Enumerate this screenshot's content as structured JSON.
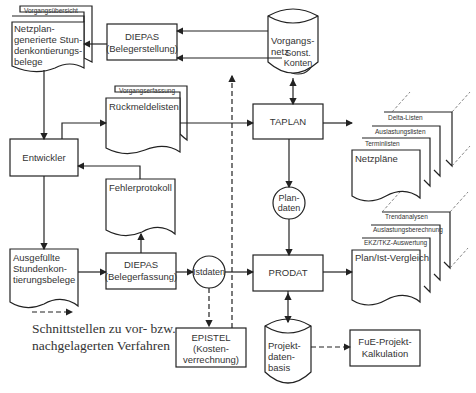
{
  "diagram": {
    "nodes": {
      "netzplan_belege": {
        "tab": "Vorgangsübersicht",
        "lines": [
          "Netzplan-",
          "generierte Stun-",
          "denkontierungs-",
          "belege"
        ]
      },
      "diepas_erstellung": {
        "lines": [
          "DIEPAS",
          "(Belegerstellung)"
        ]
      },
      "sonst_konten": {
        "lines": [
          "Sonst.",
          "Konten"
        ]
      },
      "vorgangsnetz": {
        "lines": [
          "Vorgangs-",
          "netz"
        ]
      },
      "rueckmeldelisten": {
        "tab": "Vorgangserfassung",
        "label": "Rückmeldelisten"
      },
      "taplan": {
        "label": "TAPLAN"
      },
      "netzplaene": {
        "label": "Netzpläne",
        "stack": [
          "Terminlisten",
          "Auslastungslisten",
          "Delta-Listen"
        ]
      },
      "entwickler": {
        "label": "Entwickler"
      },
      "fehlerprotokoll": {
        "label": "Fehlerprotokoll"
      },
      "plandaten": {
        "lines": [
          "Plan-",
          "daten"
        ]
      },
      "ausgefuellte_belege": {
        "lines": [
          "Ausgefüllte",
          "Stundenkon-",
          "tierungsbelege"
        ]
      },
      "diepas_erfassung": {
        "lines": [
          "DIEPAS",
          "(Belegerfassung)"
        ]
      },
      "istdaten": {
        "label": "Istdaten"
      },
      "prodat": {
        "label": "PRODAT"
      },
      "plan_ist": {
        "label": "Plan/Ist-Vergleich",
        "stack": [
          "EKZ/TKZ-Auswertung",
          "Auslastungsberechnung",
          "Trendanalysen"
        ]
      },
      "epistel": {
        "lines": [
          "EPISTEL",
          "(Kosten-",
          "verrechnung)"
        ]
      },
      "projektdatenbasis": {
        "lines": [
          "Projekt-",
          "daten-",
          "basis"
        ]
      },
      "fue_kalkulation": {
        "lines": [
          "FuE-Projekt-",
          "Kalkulation"
        ]
      }
    },
    "legend": {
      "line1": "Schnittstellen zu vor- bzw.",
      "line2": "nachgelagerten Verfahren"
    }
  }
}
